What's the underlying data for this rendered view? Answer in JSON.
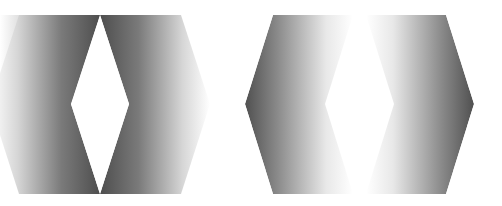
{
  "canvas": {
    "width": 502,
    "height": 206,
    "background": "#ffffff"
  },
  "figures": [
    {
      "id": "left",
      "description": "Gradient band fading outward, surrounding a white diamond",
      "dark_color": "#4a4a4a",
      "light_color": "#ffffff",
      "diamond": {
        "top": [
          100,
          15
        ],
        "left": [
          71,
          104
        ],
        "bottom": [
          100,
          194
        ],
        "right": [
          129,
          104
        ]
      },
      "outer_extent": {
        "left": 0,
        "right": 205,
        "top": 15,
        "bottom": 194
      }
    },
    {
      "id": "right",
      "description": "Hexagon dark at edges with gradient fading to white center",
      "dark_color": "#4a4a4a",
      "light_color": "#ffffff",
      "hexagon": [
        [
          273,
          15
        ],
        [
          446,
          15
        ],
        [
          474,
          104
        ],
        [
          446,
          194
        ],
        [
          273,
          194
        ],
        [
          245,
          104
        ]
      ]
    }
  ]
}
